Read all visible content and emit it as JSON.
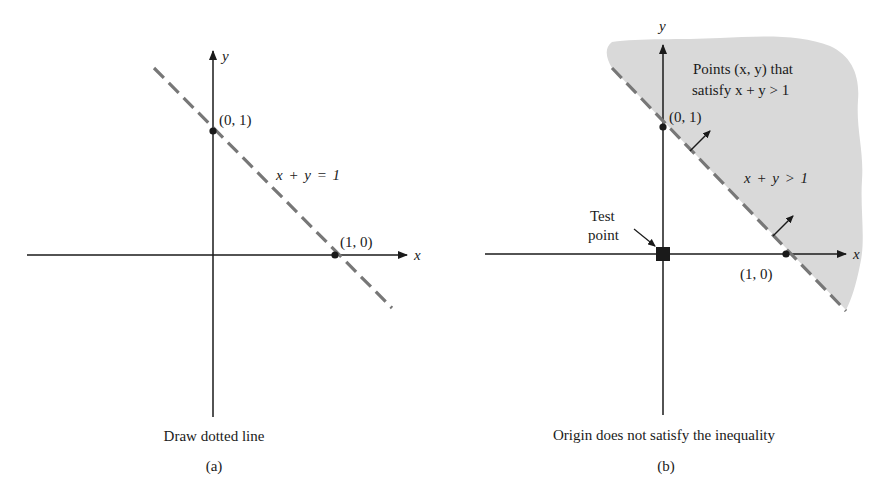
{
  "panel_a": {
    "axis_x_label": "x",
    "axis_y_label": "y",
    "point_top_label": "(0, 1)",
    "point_right_label": "(1, 0)",
    "line_label": "x + y = 1",
    "caption": "Draw dotted line",
    "sub_label": "(a)"
  },
  "panel_b": {
    "axis_x_label": "x",
    "axis_y_label": "y",
    "point_top_label": "(0, 1)",
    "point_right_label": "(1, 0)",
    "region_label_line1": "Points (x, y) that",
    "region_label_line2": "satisfy x + y > 1",
    "inequality_label": "x + y > 1",
    "test_point_label_line1": "Test",
    "test_point_label_line2": "point",
    "caption": "Origin does not satisfy the inequality",
    "sub_label": "(b)"
  },
  "colors": {
    "axis": "#1a1a1a",
    "dashed_line": "#777777",
    "shaded_region": "#d9d9d9"
  }
}
